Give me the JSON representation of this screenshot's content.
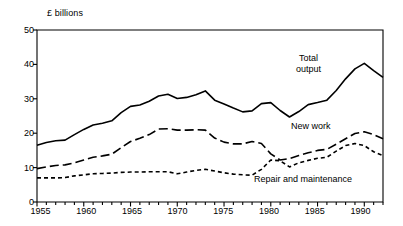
{
  "chart_data": {
    "type": "line",
    "title": "",
    "subtitle": "",
    "xlabel": "",
    "ylabel": "£ billions",
    "unit_label": "£ billions",
    "xlim": [
      1955,
      1992
    ],
    "ylim": [
      0,
      50
    ],
    "grid": false,
    "legend_position": "inline-annotations",
    "y_ticks": [
      0,
      10,
      20,
      30,
      40,
      50
    ],
    "y_tick_labels": [
      "0",
      "10",
      "20",
      "30",
      "40",
      "50"
    ],
    "x_ticks": [
      1955,
      1960,
      1965,
      1970,
      1975,
      1980,
      1985,
      1990
    ],
    "x_tick_labels": [
      "1955",
      "1960",
      "1965",
      "1970",
      "1975",
      "1980",
      "1985",
      "1990"
    ],
    "x_minor_tick_interval": 1,
    "x": [
      1955,
      1956,
      1957,
      1958,
      1959,
      1960,
      1961,
      1962,
      1963,
      1964,
      1965,
      1966,
      1967,
      1968,
      1969,
      1970,
      1971,
      1972,
      1973,
      1974,
      1975,
      1976,
      1977,
      1978,
      1979,
      1980,
      1981,
      1982,
      1983,
      1984,
      1985,
      1986,
      1987,
      1988,
      1989,
      1990,
      1991,
      1992
    ],
    "series": [
      {
        "name": "Total output",
        "label": "Total\noutput",
        "line_style": "solid",
        "color": "#000000",
        "values": [
          16.5,
          17.3,
          17.8,
          18.0,
          19.6,
          21.1,
          22.4,
          22.9,
          23.6,
          26.0,
          27.8,
          28.2,
          29.3,
          30.8,
          31.3,
          30.1,
          30.4,
          31.2,
          32.3,
          29.6,
          28.5,
          27.3,
          26.2,
          26.5,
          28.6,
          28.9,
          26.6,
          24.7,
          26.3,
          28.3,
          28.9,
          29.6,
          32.4,
          35.8,
          38.7,
          40.3,
          38.2,
          36.2
        ]
      },
      {
        "name": "New work",
        "label": "New work",
        "line_style": "long-dash",
        "color": "#000000",
        "values": [
          9.7,
          10.2,
          10.6,
          10.8,
          11.4,
          12.2,
          13.0,
          13.4,
          13.9,
          15.8,
          17.6,
          18.5,
          19.6,
          21.2,
          21.3,
          20.9,
          20.9,
          21.0,
          20.9,
          18.6,
          17.4,
          16.9,
          16.9,
          17.6,
          17.0,
          14.0,
          12.2,
          12.6,
          13.5,
          14.3,
          15.0,
          15.3,
          16.8,
          18.4,
          19.9,
          20.4,
          19.6,
          18.4
        ]
      },
      {
        "name": "Repair and maintenance",
        "label": "Repair and maintenance",
        "line_style": "short-dash",
        "color": "#000000",
        "values": [
          7.0,
          7.0,
          7.0,
          7.1,
          7.6,
          7.9,
          8.2,
          8.3,
          8.4,
          8.6,
          8.7,
          8.7,
          8.8,
          8.8,
          8.8,
          8.2,
          8.7,
          9.2,
          9.5,
          9.0,
          8.5,
          8.1,
          7.9,
          7.8,
          9.5,
          12.2,
          12.0,
          10.2,
          11.4,
          12.1,
          12.7,
          13.0,
          14.8,
          16.4,
          17.0,
          16.4,
          14.6,
          13.5
        ]
      }
    ],
    "annotations": [
      {
        "text": "Total\noutput",
        "series": "Total output"
      },
      {
        "text": "New work",
        "series": "New work"
      },
      {
        "text": "Repair and maintenance",
        "series": "Repair and maintenance"
      }
    ]
  }
}
